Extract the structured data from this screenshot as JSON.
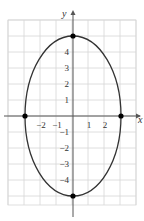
{
  "chart_data": {
    "type": "line",
    "title": "",
    "xlabel": "x",
    "ylabel": "y",
    "xlim": [
      -4,
      4
    ],
    "ylim": [
      -6,
      6
    ],
    "grid": true,
    "x_tick_labels": [
      "-2",
      "-1",
      "1",
      "2"
    ],
    "x_tick_values": [
      -2,
      -1,
      1,
      2
    ],
    "y_tick_labels": [
      "4",
      "3",
      "2",
      "1",
      "-1",
      "-2",
      "-3",
      "-4"
    ],
    "y_tick_values": [
      4,
      3,
      2,
      1,
      -1,
      -2,
      -3,
      -4
    ],
    "series": [
      {
        "name": "ellipse",
        "shape": "ellipse",
        "center": [
          0,
          0
        ],
        "semi_axis_x": 3,
        "semi_axis_y": 5,
        "color": "#333333"
      }
    ],
    "points": [
      {
        "x": 0,
        "y": 5
      },
      {
        "x": 0,
        "y": -5
      },
      {
        "x": -3,
        "y": 0
      },
      {
        "x": 3,
        "y": 0
      }
    ]
  },
  "labels": {
    "x_axis": "x",
    "y_axis": "y",
    "x_ticks": [
      "−2",
      "−1",
      "1",
      "2"
    ],
    "y_ticks": [
      "4",
      "3",
      "2",
      "1",
      "−1",
      "−2",
      "−3",
      "−4"
    ]
  },
  "colors": {
    "grid": "#d6d6d6",
    "axis": "#555555",
    "curve": "#333333",
    "point": "#000000"
  }
}
